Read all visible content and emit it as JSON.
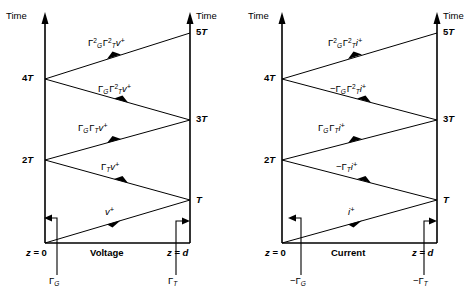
{
  "figure": {
    "type": "bounce-diagram-pair",
    "panels": [
      {
        "id": "voltage",
        "title": "Voltage",
        "axis_time_left_label": "Time",
        "axis_time_right_label": "Time",
        "left_position_label": "z = 0",
        "right_position_label": "z = d",
        "left_reflection_label": "ΓG",
        "right_reflection_label": "ΓT",
        "left_reflection_label_display": "Γ_G",
        "right_reflection_label_display": "Γ_T",
        "time_ticks_left": [
          "2T",
          "4T"
        ],
        "time_ticks_right": [
          "T",
          "3T",
          "5T"
        ],
        "wave_labels": [
          "v+",
          "ΓT v+",
          "ΓG ΓT v+",
          "ΓG ΓT² v+",
          "ΓG² ΓT² v+"
        ]
      },
      {
        "id": "current",
        "title": "Current",
        "axis_time_left_label": "Time",
        "axis_time_right_label": "Time",
        "left_position_label": "z = 0",
        "right_position_label": "z = d",
        "left_reflection_label": "-ΓG",
        "right_reflection_label": "-ΓT",
        "left_reflection_label_display": "−Γ_G",
        "right_reflection_label_display": "−Γ_T",
        "time_ticks_left": [
          "2T",
          "4T"
        ],
        "time_ticks_right": [
          "T",
          "3T",
          "5T"
        ],
        "wave_labels": [
          "i+",
          "-ΓT i+",
          "ΓG ΓT i+",
          "-ΓG ΓT² i+",
          "ΓG² ΓT² i+"
        ]
      }
    ],
    "colors": {
      "line": "#000000",
      "background": "#ffffff"
    }
  }
}
